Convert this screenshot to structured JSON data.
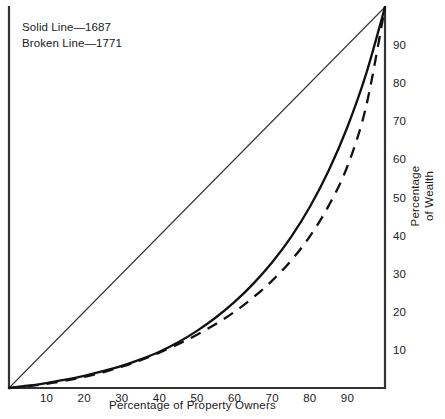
{
  "chart_data": {
    "type": "line",
    "title": "",
    "xlabel": "Percentage of Property Owners",
    "ylabel": "Percentage of Wealth",
    "xlim": [
      0,
      100
    ],
    "ylim": [
      0,
      100
    ],
    "grid": false,
    "legend_position": "top-left",
    "xticks": [
      10,
      20,
      30,
      40,
      50,
      60,
      70,
      80,
      90
    ],
    "yticks": [
      10,
      20,
      30,
      40,
      50,
      60,
      70,
      80,
      90
    ],
    "ytick_side": "right",
    "series": [
      {
        "name": "Solid Line—1687",
        "legend_label": "Solid Line—1687",
        "year": 1687,
        "style": "solid",
        "color": "#111111",
        "x": [
          0,
          5,
          10,
          15,
          20,
          25,
          30,
          35,
          40,
          45,
          50,
          55,
          60,
          65,
          70,
          75,
          80,
          85,
          90,
          95,
          100
        ],
        "y": [
          0,
          0.6,
          1.3,
          2.2,
          3.2,
          4.4,
          5.8,
          7.5,
          9.5,
          12.0,
          15.0,
          18.5,
          22.6,
          27.4,
          33.0,
          39.6,
          47.5,
          57.0,
          68.5,
          82.5,
          100
        ]
      },
      {
        "name": "Broken Line—1771",
        "legend_label": "Broken Line—1771",
        "year": 1771,
        "style": "dashed",
        "color": "#111111",
        "x": [
          0,
          5,
          10,
          15,
          20,
          25,
          30,
          35,
          40,
          45,
          50,
          55,
          60,
          65,
          70,
          75,
          80,
          85,
          90,
          95,
          100
        ],
        "y": [
          0,
          0.5,
          1.1,
          1.9,
          2.9,
          4.1,
          5.6,
          7.3,
          9.3,
          11.5,
          14.0,
          16.8,
          20.0,
          23.8,
          28.2,
          33.4,
          39.8,
          47.8,
          58.2,
          74.0,
          100
        ]
      },
      {
        "name": "Line of equality",
        "legend_label": "",
        "style": "thin-solid",
        "color": "#333333",
        "x": [
          0,
          100
        ],
        "y": [
          0,
          100
        ]
      }
    ]
  },
  "legend": {
    "entries": [
      {
        "label": "Solid Line—1687"
      },
      {
        "label": "Broken Line—1771"
      }
    ]
  },
  "axes": {
    "x_title": "Percentage of Property Owners",
    "y_title_line1": "Percentage",
    "y_title_line2": "of Wealth",
    "x_ticks": [
      "10",
      "20",
      "30",
      "40",
      "50",
      "60",
      "70",
      "80",
      "90"
    ],
    "y_ticks": [
      "10",
      "20",
      "30",
      "40",
      "50",
      "60",
      "70",
      "80",
      "90"
    ]
  },
  "colors": {
    "background": "#ffffff",
    "ink": "#111111",
    "frame": "#333333"
  }
}
